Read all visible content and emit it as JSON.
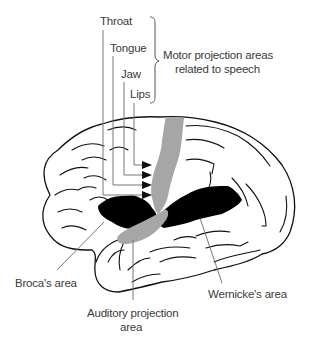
{
  "colors": {
    "language_area": "#000000",
    "projection_area": "#a6a6a6",
    "outline": "#111111",
    "leader_line": "#777777",
    "label_text": "#3a3a3a"
  },
  "motor_labels": {
    "items": [
      "Throat",
      "Tongue",
      "Jaw",
      "Lips"
    ],
    "group_label_line1": "Motor projection areas",
    "group_label_line2": "related to speech"
  },
  "region_labels": {
    "broca": "Broca's area",
    "auditory_line1": "Auditory projection",
    "auditory_line2": "area",
    "wernicke": "Wernicke's area"
  }
}
